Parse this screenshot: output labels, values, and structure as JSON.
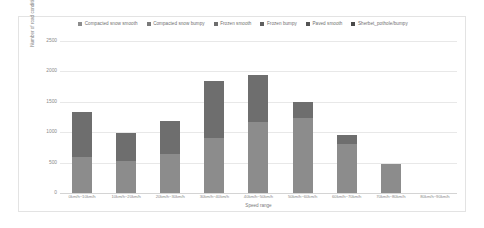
{
  "chart_data": {
    "type": "bar",
    "subtype": "stacked",
    "title": "",
    "xlabel": "Speed range",
    "ylabel": "Number of road condition",
    "ylim": [
      0,
      2500
    ],
    "yticks": [
      0,
      500,
      1000,
      1500,
      2000,
      2500
    ],
    "grid": true,
    "legend_position": "top",
    "categories": [
      "0km/h~10km/h",
      "10km/h~20km/h",
      "20km/h~30km/h",
      "30km/h~40km/h",
      "40km/h~50km/h",
      "50km/h~60km/h",
      "60km/h~70km/h",
      "70km/h~80km/h",
      "80km/h~90km/h"
    ],
    "series": [
      {
        "name": "Compacted snow smooth",
        "color": "#8c8c8c",
        "values": [
          600,
          530,
          640,
          910,
          1160,
          1230,
          800,
          470,
          0
        ]
      },
      {
        "name": "Compacted snow bumpy",
        "color": "#6e6e6e",
        "values": [
          740,
          460,
          550,
          940,
          780,
          270,
          150,
          0,
          0
        ]
      },
      {
        "name": "Frozen smooth",
        "color": "#5a5a5a",
        "values": [
          0,
          0,
          0,
          0,
          0,
          0,
          0,
          0,
          0
        ]
      },
      {
        "name": "Frozen bumpy",
        "color": "#9a9a9a",
        "values": [
          0,
          0,
          0,
          0,
          0,
          0,
          0,
          0,
          0
        ]
      },
      {
        "name": "Paved smooth",
        "color": "#7d7d7d",
        "values": [
          0,
          0,
          0,
          0,
          0,
          0,
          0,
          0,
          0
        ]
      },
      {
        "name": "Sherbet_pothole/bumpy",
        "color": "#666666",
        "values": [
          0,
          0,
          0,
          0,
          0,
          0,
          0,
          0,
          0
        ]
      }
    ],
    "totals": [
      1340,
      990,
      1190,
      1850,
      1940,
      1500,
      950,
      470,
      0
    ]
  },
  "legend": {
    "items": [
      {
        "label": "Compacted snow smooth",
        "color": "#8c8c8c"
      },
      {
        "label": "Compacted snow bumpy",
        "color": "#7a7a7a"
      },
      {
        "label": "Frozen smooth",
        "color": "#6e6e6e"
      },
      {
        "label": "Frozen bumpy",
        "color": "#5f5f5f"
      },
      {
        "label": "Paved smooth",
        "color": "#545454"
      },
      {
        "label": "Sherbet_pothole/bumpy",
        "color": "#4a4a4a"
      }
    ]
  },
  "axes": {
    "y_title": "Number of road condition",
    "x_title": "Speed range",
    "y_tick_labels": [
      "2500",
      "2000",
      "1500",
      "1000",
      "500",
      "0"
    ]
  }
}
